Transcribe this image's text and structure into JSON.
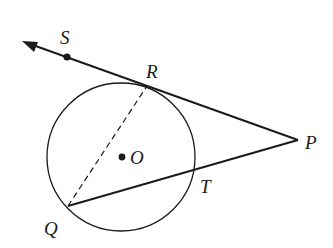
{
  "diagram": {
    "type": "geometry",
    "colors": {
      "stroke": "#1a1a1a",
      "background": "#ffffff"
    },
    "circle": {
      "center_label": "O",
      "cx": 121,
      "cy": 157,
      "r": 74
    },
    "points": [
      {
        "label": "S",
        "x": 67,
        "y": 57,
        "label_x": 60,
        "label_y": 44
      },
      {
        "label": "R",
        "x": 147,
        "y": 86,
        "label_x": 146,
        "label_y": 78
      },
      {
        "label": "P",
        "x": 298,
        "y": 140,
        "label_x": 305,
        "label_y": 149
      },
      {
        "label": "T",
        "x": 195,
        "y": 170,
        "label_x": 200,
        "label_y": 193
      },
      {
        "label": "Q",
        "x": 68,
        "y": 206,
        "label_x": 44,
        "label_y": 235
      },
      {
        "label": "O",
        "x": 122,
        "y": 157,
        "label_x": 130,
        "label_y": 164
      }
    ],
    "segments": [
      {
        "name": "ray-PS",
        "from": "P",
        "to": "arrow",
        "style": "solid",
        "arrow": true
      },
      {
        "name": "secant-PQ",
        "from": "P",
        "to": "Q",
        "style": "solid"
      },
      {
        "name": "chord-QR",
        "from": "Q",
        "to": "R",
        "style": "dashed"
      }
    ],
    "labels": {
      "S": "S",
      "R": "R",
      "P": "P",
      "T": "T",
      "Q": "Q",
      "O": "O"
    }
  }
}
